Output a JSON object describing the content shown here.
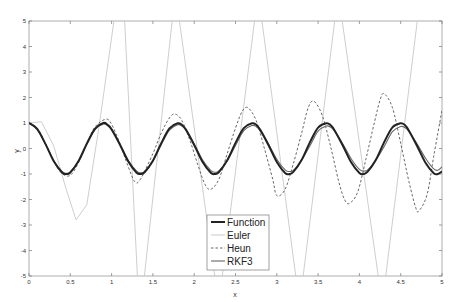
{
  "chart_data": {
    "type": "line",
    "title": "",
    "xlabel": "x",
    "ylabel": "y",
    "xlim": [
      0,
      5
    ],
    "ylim": [
      -5,
      5
    ],
    "grid": false,
    "legend_position": "lower center",
    "x_ticks": [
      0,
      0.5,
      1,
      1.5,
      2,
      2.5,
      3,
      3.5,
      4,
      4.5,
      5
    ],
    "x_tick_labels": [
      "0",
      "0.5",
      "1",
      "1.5",
      "2",
      "2.5",
      "3",
      "3.5",
      "4",
      "4.5",
      "5"
    ],
    "y_ticks": [
      -5,
      -4,
      -3,
      -2,
      -1,
      0,
      1,
      2,
      3,
      4,
      5
    ],
    "y_tick_labels": [
      "-5",
      "-4",
      "-3",
      "-2",
      "-1",
      "0",
      "1",
      "2",
      "3",
      "4",
      "5"
    ],
    "series": [
      {
        "name": "Function",
        "style": "solid-thick",
        "color": "#222222",
        "x": [
          0,
          0.1,
          0.2,
          0.3,
          0.4,
          0.45,
          0.5,
          0.6,
          0.7,
          0.8,
          0.9,
          0.95,
          1.0,
          1.1,
          1.2,
          1.3,
          1.35,
          1.4,
          1.5,
          1.6,
          1.7,
          1.8,
          1.85,
          1.9,
          2.0,
          2.1,
          2.2,
          2.25,
          2.3,
          2.4,
          2.5,
          2.6,
          2.7,
          2.75,
          2.8,
          2.9,
          3.0,
          3.1,
          3.15,
          3.2,
          3.3,
          3.4,
          3.5,
          3.6,
          3.65,
          3.7,
          3.8,
          3.9,
          4.0,
          4.05,
          4.1,
          4.2,
          4.3,
          4.4,
          4.5,
          4.55,
          4.6,
          4.7,
          4.8,
          4.9,
          4.95,
          5.0
        ],
        "y": [
          1.0,
          0.76,
          0.17,
          -0.5,
          -0.94,
          -1.0,
          -0.94,
          -0.49,
          0.19,
          0.78,
          1.0,
          0.93,
          0.75,
          0.16,
          -0.5,
          -0.94,
          -1.0,
          -0.93,
          -0.48,
          0.2,
          0.79,
          0.99,
          0.93,
          0.74,
          0.14,
          -0.52,
          -0.95,
          -1.0,
          -0.92,
          -0.46,
          0.22,
          0.8,
          0.99,
          0.93,
          0.73,
          0.13,
          -0.53,
          -0.96,
          -1.0,
          -0.92,
          -0.45,
          0.24,
          0.82,
          0.99,
          0.92,
          0.71,
          0.11,
          -0.54,
          -0.96,
          -1.0,
          -0.91,
          -0.44,
          0.25,
          0.83,
          0.99,
          0.92,
          0.7,
          0.09,
          -0.56,
          -0.97,
          -1.0,
          -0.9
        ]
      },
      {
        "name": "Euler",
        "style": "solid-thin",
        "color": "#c8c8c8",
        "x": [
          0,
          0.15,
          0.3,
          0.45,
          0.57,
          0.7,
          0.85,
          0.95,
          1.05,
          1.15,
          1.32,
          1.38,
          1.75,
          1.8,
          2.27,
          2.32,
          2.75,
          2.8,
          3.25,
          3.3,
          3.72,
          3.77,
          4.25,
          4.3,
          4.72,
          4.77
        ],
        "y": [
          1.0,
          1.05,
          0.1,
          -1.6,
          -2.8,
          -2.2,
          0.9,
          3.2,
          5.5,
          5.5,
          -5.5,
          -5.5,
          5.5,
          5.5,
          -5.5,
          -5.5,
          5.5,
          5.5,
          -5.5,
          -5.5,
          5.5,
          5.5,
          -5.5,
          -5.5,
          5.5,
          5.5
        ]
      },
      {
        "name": "Heun",
        "style": "dashed",
        "color": "#555555",
        "x": [
          0,
          0.1,
          0.2,
          0.3,
          0.4,
          0.5,
          0.6,
          0.7,
          0.8,
          0.93,
          1.0,
          1.1,
          1.2,
          1.28,
          1.35,
          1.5,
          1.6,
          1.7,
          1.77,
          1.85,
          1.95,
          2.05,
          2.13,
          2.2,
          2.3,
          2.4,
          2.5,
          2.58,
          2.65,
          2.75,
          2.85,
          2.95,
          3.0,
          3.1,
          3.2,
          3.3,
          3.38,
          3.45,
          3.55,
          3.65,
          3.75,
          3.82,
          3.88,
          3.98,
          4.08,
          4.18,
          4.25,
          4.3,
          4.4,
          4.5,
          4.6,
          4.68,
          4.72,
          4.82,
          4.9,
          5.0
        ],
        "y": [
          1.0,
          0.8,
          0.2,
          -0.5,
          -0.98,
          -1.05,
          -0.55,
          0.2,
          0.85,
          1.15,
          0.95,
          0.2,
          -0.7,
          -1.3,
          -1.2,
          -0.2,
          0.6,
          1.2,
          1.35,
          1.1,
          0.3,
          -0.7,
          -1.4,
          -1.6,
          -1.2,
          -0.2,
          0.8,
          1.45,
          1.6,
          1.1,
          0.0,
          -1.2,
          -1.85,
          -1.6,
          -0.6,
          0.6,
          1.6,
          1.85,
          1.3,
          0.1,
          -1.3,
          -2.0,
          -2.15,
          -1.7,
          -0.4,
          1.0,
          1.9,
          2.15,
          1.6,
          0.2,
          -1.3,
          -2.3,
          -2.45,
          -1.8,
          -0.3,
          1.5
        ]
      },
      {
        "name": "RKF3",
        "style": "solid-medium",
        "color": "#666666",
        "x": [
          0,
          0.1,
          0.2,
          0.3,
          0.4,
          0.45,
          0.5,
          0.6,
          0.7,
          0.8,
          0.9,
          0.95,
          1.0,
          1.1,
          1.2,
          1.3,
          1.35,
          1.4,
          1.5,
          1.6,
          1.7,
          1.8,
          1.85,
          1.9,
          2.0,
          2.1,
          2.2,
          2.25,
          2.3,
          2.4,
          2.5,
          2.6,
          2.7,
          2.75,
          2.8,
          2.9,
          3.0,
          3.1,
          3.15,
          3.2,
          3.3,
          3.4,
          3.5,
          3.6,
          3.65,
          3.7,
          3.8,
          3.9,
          4.0,
          4.05,
          4.1,
          4.2,
          4.3,
          4.4,
          4.5,
          4.55,
          4.6,
          4.7,
          4.8,
          4.9,
          4.95,
          5.0
        ],
        "y": [
          1.0,
          0.76,
          0.18,
          -0.48,
          -0.9,
          -0.97,
          -0.92,
          -0.5,
          0.16,
          0.74,
          0.96,
          0.9,
          0.74,
          0.18,
          -0.45,
          -0.88,
          -0.95,
          -0.9,
          -0.5,
          0.14,
          0.72,
          0.93,
          0.88,
          0.72,
          0.18,
          -0.44,
          -0.86,
          -0.93,
          -0.88,
          -0.48,
          0.12,
          0.7,
          0.9,
          0.86,
          0.7,
          0.18,
          -0.42,
          -0.84,
          -0.9,
          -0.86,
          -0.46,
          0.1,
          0.68,
          0.88,
          0.84,
          0.68,
          0.18,
          -0.4,
          -0.82,
          -0.88,
          -0.84,
          -0.45,
          0.08,
          0.66,
          0.86,
          0.82,
          0.66,
          0.17,
          -0.38,
          -0.8,
          -0.85,
          -0.72
        ]
      }
    ]
  },
  "legend": {
    "items": [
      {
        "label": "Function"
      },
      {
        "label": "Euler"
      },
      {
        "label": "Heun"
      },
      {
        "label": "RKF3"
      }
    ]
  }
}
